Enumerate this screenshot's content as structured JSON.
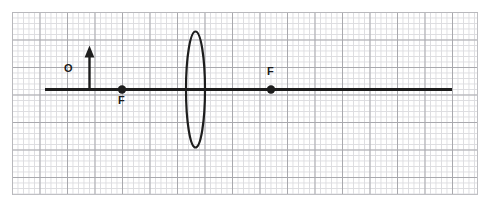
{
  "figure": {
    "kind": "optics-ray-diagram",
    "background": "#ffffff",
    "ink_color": "#1d1d1d",
    "grid": {
      "minor_color": "#dcdce0",
      "major_color": "#a9a9ae",
      "minor_spacing_px": 5.5,
      "major_spacing_px": 27.5,
      "left": 12,
      "top": 12,
      "width": 466,
      "height": 183
    },
    "principal_axis": {
      "label": "",
      "x1": 45,
      "x2": 452,
      "y": 89,
      "thickness": 3
    },
    "lens": {
      "type": "converging-convex-lens",
      "center_x": 195.5,
      "center_y": 89,
      "semi_width": 9.5,
      "semi_height": 58,
      "stroke": 2.2
    },
    "object": {
      "label": "O",
      "x": 89,
      "base_y": 89,
      "tip_y": 47,
      "arrow_head_width": 9,
      "arrow_head_height": 11
    },
    "focal_points": [
      {
        "label": "F",
        "x": 122,
        "y": 89,
        "label_position": "below",
        "radius": 4.2
      },
      {
        "label": "F",
        "x": 271,
        "y": 89,
        "label_position": "above",
        "radius": 4.2
      }
    ],
    "watermark_text": ""
  }
}
